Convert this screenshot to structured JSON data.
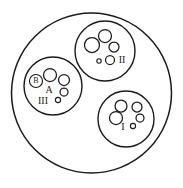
{
  "figure": {
    "background_color": "#ffffff",
    "line_color": "#1a1a1a",
    "width": 183,
    "height": 188,
    "outer_region": {
      "name": "outer-boundary",
      "cx": 91.5,
      "cy": 93,
      "r": 80
    },
    "clusters": [
      {
        "id": "cluster-iii",
        "label": "III",
        "secondary_labels": [
          "A",
          "B"
        ],
        "cx": 53,
        "cy": 86,
        "r": 29,
        "label_x": 43,
        "label_y": 102,
        "sublabel_a_x": 49,
        "sublabel_a_y": 91,
        "badge": {
          "label": "B",
          "cx": 36,
          "cy": 81,
          "r": 6.5
        },
        "vesicles": [
          {
            "cx": 50,
            "cy": 75,
            "r": 6.5
          },
          {
            "cx": 64,
            "cy": 80,
            "r": 5.5
          },
          {
            "cx": 64,
            "cy": 92,
            "r": 4.0
          },
          {
            "cx": 58,
            "cy": 100,
            "r": 2.6
          }
        ]
      },
      {
        "id": "cluster-ii",
        "label": "II",
        "secondary_labels": [],
        "cx": 105,
        "cy": 51,
        "r": 30,
        "label_x": 122,
        "label_y": 61,
        "badge": null,
        "vesicles": [
          {
            "cx": 92,
            "cy": 45,
            "r": 7.5
          },
          {
            "cx": 105,
            "cy": 36,
            "r": 6.5
          },
          {
            "cx": 114,
            "cy": 47,
            "r": 5.0
          },
          {
            "cx": 110,
            "cy": 60,
            "r": 4.5
          },
          {
            "cx": 99,
            "cy": 61,
            "r": 2.2
          }
        ]
      },
      {
        "id": "cluster-i",
        "label": "I",
        "secondary_labels": [],
        "cx": 126,
        "cy": 119,
        "r": 28,
        "label_x": 123,
        "label_y": 128,
        "badge": null,
        "vesicles": [
          {
            "cx": 121,
            "cy": 106,
            "r": 6.0
          },
          {
            "cx": 137,
            "cy": 107,
            "r": 5.0
          },
          {
            "cx": 116,
            "cy": 118,
            "r": 6.5
          },
          {
            "cx": 140,
            "cy": 118,
            "r": 4.0
          },
          {
            "cx": 133,
            "cy": 126,
            "r": 2.6
          }
        ]
      }
    ]
  }
}
